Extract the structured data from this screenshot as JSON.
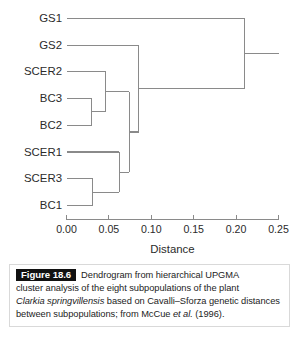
{
  "figure": {
    "tag": "Figure 18.6",
    "caption_lines": [
      "Dendrogram from hierarchical UPGMA",
      "cluster analysis of the eight subpopulations of the plant",
      "based on Cavalli–Sforza genetic distances",
      "between subpopulations; from McCue",
      "(1996)."
    ],
    "caption_italic_species": "Clarkia springvillensis",
    "caption_italic_etal": "et al."
  },
  "chart_data": {
    "type": "dendrogram",
    "title": "",
    "xlabel": "Distance",
    "ylabel": "",
    "xlim": [
      0.0,
      0.25
    ],
    "xticks": [
      0.0,
      0.05,
      0.1,
      0.15,
      0.2,
      0.25
    ],
    "xtick_labels": [
      "0.00",
      "0.05",
      "0.10",
      "0.15",
      "0.20",
      "0.25"
    ],
    "grid": false,
    "orientation": "horizontal-left-to-right",
    "leaves": [
      "GS1",
      "GS2",
      "SCER2",
      "BC3",
      "BC2",
      "SCER1",
      "SCER3",
      "BC1"
    ],
    "merges": [
      {
        "id": "n1",
        "children": [
          "BC3",
          "BC2"
        ],
        "height": 0.03
      },
      {
        "id": "n2",
        "children": [
          "SCER2",
          "n1"
        ],
        "height": 0.046
      },
      {
        "id": "n3",
        "children": [
          "SCER3",
          "BC1"
        ],
        "height": 0.031
      },
      {
        "id": "n4",
        "children": [
          "SCER1",
          "n3"
        ],
        "height": 0.062
      },
      {
        "id": "n5",
        "children": [
          "n2",
          "n4"
        ],
        "height": 0.074
      },
      {
        "id": "n6",
        "children": [
          "GS2",
          "n5"
        ],
        "height": 0.085
      },
      {
        "id": "n7",
        "children": [
          "GS1",
          "n6"
        ],
        "height": 0.21
      }
    ],
    "root_height": 0.21,
    "line_color": "#8a8a8a"
  }
}
